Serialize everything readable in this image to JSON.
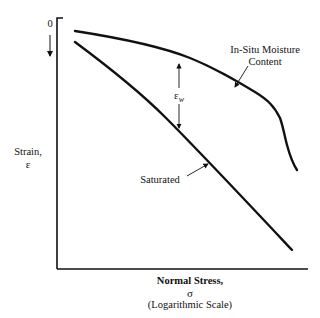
{
  "diagram": {
    "y_axis": {
      "origin_label": "0",
      "label_line1": "Strain,",
      "label_line2": "ε",
      "direction": "increasing downward"
    },
    "x_axis": {
      "label_line1": "Normal Stress,",
      "label_line2": "σ",
      "label_line3": "(Logarithmic Scale)"
    },
    "curves": [
      {
        "name": "In-Situ Moisture Content",
        "label_line1": "In-Situ Moisture",
        "label_line2": "Content"
      },
      {
        "name": "Saturated",
        "label": "Saturated"
      }
    ],
    "annotation": {
      "symbol": "ε",
      "subscript": "w",
      "meaning": "strain difference between in-situ and saturated curves"
    },
    "colors": {
      "line": "#111111",
      "background": "#ffffff"
    }
  }
}
